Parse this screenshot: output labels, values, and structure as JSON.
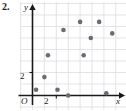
{
  "figure": {
    "problem_number": "2.",
    "accent_color": "#6b6b73",
    "grid_color": "#d9d9de",
    "axis_color": "#1a1a1a"
  },
  "labels": {
    "origin": "O",
    "x_axis_name": "x",
    "y_axis_name": "y",
    "x_tick_2": "2",
    "y_tick_2": "2"
  },
  "chart_data": {
    "type": "scatter",
    "title": "",
    "xlabel": "x",
    "ylabel": "y",
    "xlim": [
      -0.6,
      7.8
    ],
    "ylim": [
      -0.6,
      7.4
    ],
    "grid": true,
    "legend": null,
    "xticks": [
      2
    ],
    "xticklabels": [
      "2"
    ],
    "yticks": [
      2
    ],
    "yticklabels": [
      "2"
    ],
    "origin_label": "O",
    "x": [
      0.3,
      1.0,
      1.3,
      2.1,
      2.6,
      3.0,
      4.0,
      4.3,
      4.9,
      5.6,
      6.2,
      6.7
    ],
    "y": [
      0.5,
      1.6,
      3.5,
      0.5,
      5.7,
      0.0,
      6.4,
      3.5,
      5.0,
      6.4,
      0.2,
      5.4
    ],
    "points": [
      {
        "x": 0.3,
        "y": 0.5
      },
      {
        "x": 1.0,
        "y": 1.6
      },
      {
        "x": 1.3,
        "y": 3.5
      },
      {
        "x": 2.1,
        "y": 0.5
      },
      {
        "x": 2.6,
        "y": 5.7
      },
      {
        "x": 3.0,
        "y": 0.0
      },
      {
        "x": 4.0,
        "y": 6.4
      },
      {
        "x": 4.3,
        "y": 3.5
      },
      {
        "x": 4.9,
        "y": 5.0
      },
      {
        "x": 5.6,
        "y": 6.4
      },
      {
        "x": 6.2,
        "y": 0.2
      },
      {
        "x": 6.7,
        "y": 5.4
      }
    ]
  }
}
